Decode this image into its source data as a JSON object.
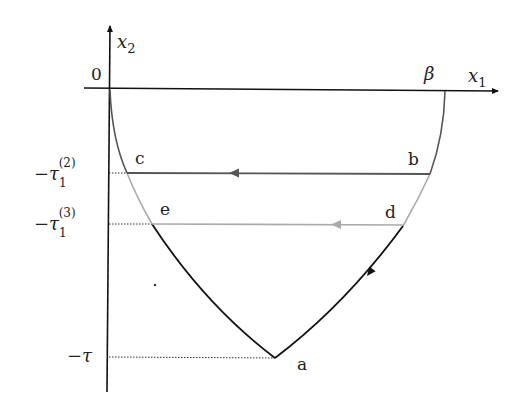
{
  "diagram": {
    "axes": {
      "x_label": "x",
      "x_sub": "1",
      "y_label": "x",
      "y_sub": "2",
      "origin_label": "0",
      "beta_label": "β"
    },
    "y_ticks": [
      {
        "label": "−τ",
        "sub": "1",
        "sup": "(2)"
      },
      {
        "label": "−τ",
        "sub": "1",
        "sup": "(3)"
      },
      {
        "label": "−τ",
        "sub": "",
        "sup": ""
      }
    ],
    "points": {
      "a": "a",
      "b": "b",
      "c": "c",
      "d": "d",
      "e": "e"
    },
    "colors": {
      "black": "#111111",
      "dark_gray": "#555555",
      "light_gray": "#aaaaaa"
    }
  }
}
